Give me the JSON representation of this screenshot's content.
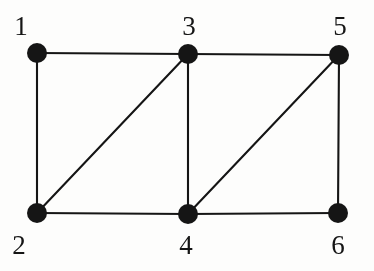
{
  "figure": {
    "kind": "undirected-graph-diagram",
    "background_color": "#fdfdfc",
    "ink_color": "#151515",
    "canvas": {
      "width": 374,
      "height": 271
    },
    "node_radius": 10,
    "edge_width": 2.1
  },
  "nodes": [
    {
      "id": "1",
      "label": "1",
      "cx": 37,
      "cy": 53,
      "label_x": 7,
      "label_y": 13
    },
    {
      "id": "2",
      "label": "2",
      "cx": 37,
      "cy": 213,
      "label_x": 5,
      "label_y": 232
    },
    {
      "id": "3",
      "label": "3",
      "cx": 188,
      "cy": 54,
      "label_x": 175,
      "label_y": 13
    },
    {
      "id": "4",
      "label": "4",
      "cx": 188,
      "cy": 214,
      "label_x": 172,
      "label_y": 232
    },
    {
      "id": "5",
      "label": "5",
      "cx": 339,
      "cy": 55,
      "label_x": 326,
      "label_y": 13
    },
    {
      "id": "6",
      "label": "6",
      "cx": 338,
      "cy": 213,
      "label_x": 324,
      "label_y": 232
    }
  ],
  "edges": [
    {
      "id": "e-1-3",
      "from": "1",
      "to": "3",
      "kind": "horizontal-top-left"
    },
    {
      "id": "e-3-5",
      "from": "3",
      "to": "5",
      "kind": "horizontal-top-right"
    },
    {
      "id": "e-2-4",
      "from": "2",
      "to": "4",
      "kind": "horizontal-bottom-left"
    },
    {
      "id": "e-4-6",
      "from": "4",
      "to": "6",
      "kind": "horizontal-bottom-right"
    },
    {
      "id": "e-1-2",
      "from": "1",
      "to": "2",
      "kind": "vertical-left"
    },
    {
      "id": "e-3-4",
      "from": "3",
      "to": "4",
      "kind": "vertical-middle"
    },
    {
      "id": "e-5-6",
      "from": "5",
      "to": "6",
      "kind": "vertical-right"
    },
    {
      "id": "e-2-3",
      "from": "2",
      "to": "3",
      "kind": "diagonal-left"
    },
    {
      "id": "e-4-5",
      "from": "4",
      "to": "5",
      "kind": "diagonal-right"
    }
  ]
}
